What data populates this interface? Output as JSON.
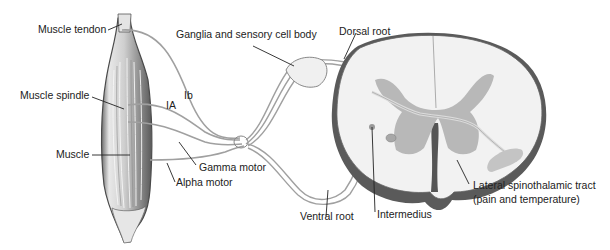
{
  "diagram": {
    "labels": {
      "muscle_tendon": "Muscle tendon",
      "muscle_spindle": "Muscle spindle",
      "muscle": "Muscle",
      "ib": "Ib",
      "ia": "IA",
      "ganglia": "Ganglia and sensory cell body",
      "dorsal_root": "Dorsal root",
      "gamma_motor": "Gamma motor",
      "alpha_motor": "Alpha motor",
      "ventral_root": "Ventral root",
      "intermedius": "Intermedius",
      "lateral_tract_line1": "Lateral spinothalamic tract",
      "lateral_tract_line2": "(pain and temperature)"
    },
    "colors": {
      "outline": "#555555",
      "white_matter": "#f2f2f2",
      "gray_matter": "#b8b8b8",
      "nerve": "#9a9a9a",
      "muscle_dark": "#7a7a7a",
      "muscle_light": "#d8d8d8",
      "text": "#222222"
    }
  }
}
